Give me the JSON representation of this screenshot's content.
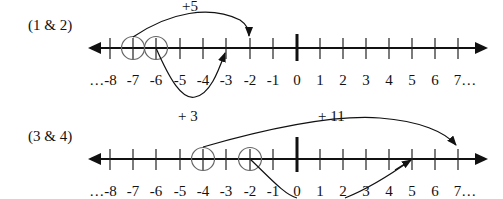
{
  "problems": [
    {
      "label": "(1 & 2)",
      "jump_label": "+5",
      "ticks": [
        "…-8",
        "-7",
        "-6",
        "-5",
        "-4",
        "-3",
        "-2",
        "-1",
        "0",
        "1",
        "2",
        "3",
        "4",
        "5",
        "6",
        "7…"
      ],
      "circled": [
        -7,
        -6
      ],
      "upper_arc": {
        "from": -7,
        "to": -2,
        "label": "+5"
      },
      "lower_arc": {
        "from": -6,
        "to": -3
      }
    },
    {
      "label": "(3 & 4)",
      "jump_label": "+ 3",
      "jump_label_2": "+ 11",
      "ticks": [
        "…-8",
        "-7",
        "-6",
        "-5",
        "-4",
        "-3",
        "-2",
        "-1",
        "0",
        "1",
        "2",
        "3",
        "4",
        "5",
        "6",
        "7…"
      ],
      "circled": [
        -4,
        -2
      ],
      "upper_arc": {
        "from": -4,
        "to": 7,
        "label": "+ 11"
      },
      "lower_arc": {
        "from": -2,
        "to": 5
      }
    }
  ],
  "colors": {
    "line": "#111111",
    "circle": "#666666"
  }
}
